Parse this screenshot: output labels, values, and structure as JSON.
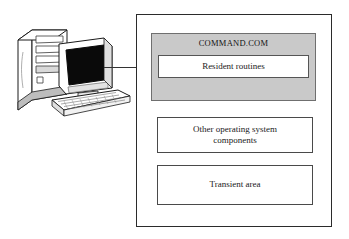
{
  "diagram": {
    "illustration": {
      "name": "desktop-computer",
      "parts": [
        "tower-case",
        "crt-monitor",
        "keyboard"
      ],
      "screen_color": "#050505",
      "case_color": "#ffffff",
      "outline_color": "#1a1a1a"
    },
    "connector": {
      "name": "leader-line",
      "color": "#333333"
    },
    "memory_map": {
      "name": "memory-map",
      "border_color": "#2b2b2b",
      "background": "#ffffff",
      "segments": [
        {
          "id": "command-com",
          "title": "COMMAND.COM",
          "fill": "#c9c9c9",
          "inner": {
            "id": "resident-routines",
            "label": "Resident routines",
            "fill": "#ffffff"
          }
        },
        {
          "id": "other-os-components",
          "label": "Other operating system components",
          "line1": "Other operating system",
          "line2": "components",
          "fill": "#ffffff"
        },
        {
          "id": "transient-area",
          "label": "Transient area",
          "fill": "#ffffff"
        }
      ]
    }
  }
}
